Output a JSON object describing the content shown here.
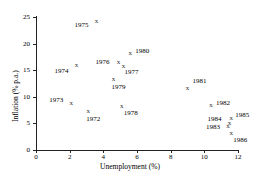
{
  "chart_data": {
    "type": "scatter",
    "title": "",
    "xlabel": "Unemployment (%)",
    "ylabel": "Inflation (% p.a.)",
    "xlim": [
      0,
      12
    ],
    "ylim": [
      0,
      25
    ],
    "xticks": [
      0,
      2,
      4,
      6,
      8,
      10,
      12
    ],
    "yticks": [
      0,
      5,
      10,
      15,
      20,
      25
    ],
    "grid": false,
    "legend": false,
    "marker": "x",
    "points": [
      {
        "label": "1972",
        "x": 3.1,
        "y": 7.3,
        "lx": -2,
        "ly": 8
      },
      {
        "label": "1973",
        "x": 2.1,
        "y": 8.8,
        "lx": -22,
        "ly": -3
      },
      {
        "label": "1974",
        "x": 2.4,
        "y": 16.0,
        "lx": -22,
        "ly": 6
      },
      {
        "label": "1975",
        "x": 3.6,
        "y": 24.2,
        "lx": -22,
        "ly": 4
      },
      {
        "label": "1976",
        "x": 4.9,
        "y": 16.5,
        "lx": -23,
        "ly": 0
      },
      {
        "label": "1977",
        "x": 5.2,
        "y": 15.8,
        "lx": 1,
        "ly": 6
      },
      {
        "label": "1978",
        "x": 5.1,
        "y": 8.2,
        "lx": 2,
        "ly": 7
      },
      {
        "label": "1979",
        "x": 4.6,
        "y": 13.4,
        "lx": -2,
        "ly": 8
      },
      {
        "label": "1980",
        "x": 5.6,
        "y": 18.3,
        "lx": 5,
        "ly": -2
      },
      {
        "label": "1981",
        "x": 9.0,
        "y": 11.7,
        "lx": 5,
        "ly": -7
      },
      {
        "label": "1982",
        "x": 10.4,
        "y": 8.5,
        "lx": 5,
        "ly": -2
      },
      {
        "label": "1983",
        "x": 11.4,
        "y": 4.5,
        "lx": -22,
        "ly": 1
      },
      {
        "label": "1984",
        "x": 11.5,
        "y": 5.0,
        "lx": -22,
        "ly": -4
      },
      {
        "label": "1985",
        "x": 11.6,
        "y": 6.0,
        "lx": 4,
        "ly": -3
      },
      {
        "label": "1986",
        "x": 11.6,
        "y": 3.2,
        "lx": 2,
        "ly": 7
      }
    ]
  },
  "colors": {
    "axis": "#222222",
    "marker": "#333333",
    "text": "#000000",
    "background": "#ffffff"
  }
}
